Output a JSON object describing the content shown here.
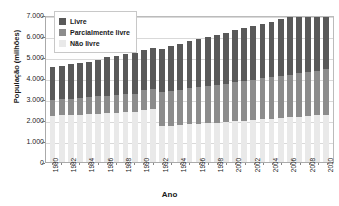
{
  "chart_data": {
    "type": "bar",
    "subtype": "stacked",
    "title": "",
    "xlabel": "Ano",
    "ylabel": "População (milhões)",
    "ylim": [
      0,
      7000
    ],
    "ytick_values": [
      0,
      1000,
      2000,
      3000,
      4000,
      5000,
      6000,
      7000
    ],
    "ytick_labels": [
      "0",
      "1.000",
      "2.000",
      "3.000",
      "4.000",
      "5.000",
      "6.000",
      "7.000"
    ],
    "grid": true,
    "legend_position": "top-left",
    "legend": [
      "Livre",
      "Parcialmente livre",
      "Não livre"
    ],
    "colors": {
      "livre": "#595959",
      "parcialmente_livre": "#8c8c8c",
      "nao_livre": "#e9e9e9"
    },
    "categories": [
      "1980",
      "1981",
      "1982",
      "1983",
      "1984",
      "1985",
      "1986",
      "1987",
      "1988",
      "1989",
      "1990",
      "1991",
      "1992",
      "1993",
      "1994",
      "1995",
      "1996",
      "1997",
      "1998",
      "1999",
      "2000",
      "2001",
      "2002",
      "2003",
      "2004",
      "2005",
      "2006",
      "2007",
      "2008",
      "2009",
      "2010"
    ],
    "x_tick_labels_shown": [
      "1980",
      "1982",
      "1984",
      "1986",
      "1988",
      "1990",
      "1992",
      "1994",
      "1996",
      "1998",
      "2000",
      "2002",
      "2004",
      "2006",
      "2008",
      "2010"
    ],
    "series": [
      {
        "name": "Não livre",
        "key": "nao_livre",
        "values": [
          2200,
          2220,
          2240,
          2260,
          2290,
          2310,
          2330,
          2350,
          2360,
          2380,
          2500,
          2530,
          1700,
          1730,
          1760,
          1790,
          1820,
          1840,
          1870,
          1900,
          1940,
          1970,
          2000,
          2030,
          2060,
          2090,
          2120,
          2150,
          2190,
          2220,
          2260
        ]
      },
      {
        "name": "Parcialmente livre",
        "key": "parcialmente_livre",
        "values": [
          760,
          770,
          780,
          790,
          800,
          820,
          830,
          845,
          860,
          870,
          920,
          940,
          1620,
          1650,
          1680,
          1720,
          1740,
          1775,
          1800,
          1830,
          1860,
          1890,
          1920,
          1950,
          1980,
          2010,
          2040,
          2070,
          2100,
          2130,
          2160
        ]
      },
      {
        "name": "Livre",
        "key": "livre",
        "values": [
          1570,
          1600,
          1630,
          1660,
          1690,
          1740,
          1830,
          1865,
          1910,
          1940,
          1930,
          1960,
          2080,
          2140,
          2190,
          2250,
          2290,
          2345,
          2390,
          2430,
          2480,
          2520,
          2560,
          2610,
          2650,
          2690,
          2730,
          2770,
          2810,
          2850,
          2480
        ]
      }
    ],
    "totals": [
      4530,
      4590,
      4650,
      4710,
      4780,
      4870,
      4990,
      5060,
      5130,
      5190,
      5350,
      5430,
      5400,
      5520,
      5630,
      5760,
      5850,
      5960,
      6060,
      6160,
      6280,
      6380,
      6480,
      6590,
      6690,
      6790,
      6890,
      6990,
      7100,
      7200,
      6900
    ]
  }
}
